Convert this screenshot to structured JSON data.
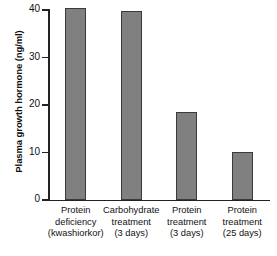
{
  "chart_data": {
    "type": "bar",
    "title": "",
    "xlabel": "",
    "ylabel": "Plasma growth hormone (ng/ml)",
    "ylim": [
      0,
      40
    ],
    "yticks": [
      0,
      10,
      20,
      30,
      40
    ],
    "ytick_labels": [
      "0",
      "10",
      "20",
      "30",
      "40"
    ],
    "grid": false,
    "legend": null,
    "bar_color": "#808080",
    "bar_edge_color": "#3a3a3a",
    "axis_color": "#222222",
    "categories": [
      "Protein deficiency (kwashiorkor)",
      "Carbohydrate treatment (3 days)",
      "Protein treatment (3 days)",
      "Protein treatment (25 days)"
    ],
    "category_lines": [
      [
        "Protein",
        "deficiency",
        "(kwashiorkor)"
      ],
      [
        "Carbohydrate",
        "treatment",
        "(3 days)"
      ],
      [
        "Protein",
        "treatment",
        "(3 days)"
      ],
      [
        "Protein",
        "treatment",
        "(25 days)"
      ]
    ],
    "values": [
      40.5,
      39.8,
      18.6,
      10.2
    ]
  }
}
